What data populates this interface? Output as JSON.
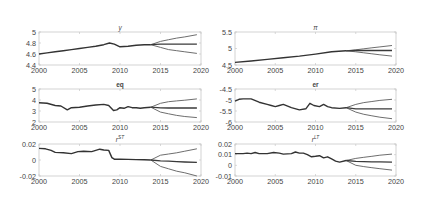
{
  "figure": {
    "width": 425,
    "height": 201,
    "background": "#ffffff",
    "axis_color": "#c8c8c8",
    "tick_label_color": "#4a4a4a",
    "history_color": "#333333",
    "forecast_central_color": "#3a3a3a",
    "forecast_band_color": "#6e6e6e"
  },
  "chart_data": [
    {
      "id": "y",
      "type": "line",
      "title": "y",
      "title_style": "italic",
      "xlim": [
        2000,
        2020
      ],
      "ylim": [
        4.4,
        5
      ],
      "xticks": [
        2000,
        2005,
        2010,
        2015,
        2020
      ],
      "yticks": [
        4.4,
        4.6,
        4.8,
        5
      ],
      "ytick_labels": [
        "4.4",
        "4.6",
        "4.8",
        "5"
      ],
      "show_xtick_labels": true,
      "history": {
        "x": [
          2000,
          2001,
          2002,
          2003,
          2004,
          2005,
          2006,
          2007,
          2008,
          2008.7,
          2009.3,
          2010,
          2011,
          2012,
          2013,
          2013.8
        ],
        "y": [
          4.6,
          4.62,
          4.64,
          4.66,
          4.68,
          4.7,
          4.72,
          4.74,
          4.77,
          4.8,
          4.78,
          4.73,
          4.74,
          4.76,
          4.77,
          4.77
        ]
      },
      "forecast": {
        "x": [
          2013.8,
          2015,
          2016,
          2017,
          2018,
          2019.5
        ],
        "upper": [
          4.77,
          4.83,
          4.86,
          4.89,
          4.91,
          4.95
        ],
        "central": [
          4.77,
          4.78,
          4.78,
          4.78,
          4.78,
          4.78
        ],
        "lower": [
          4.77,
          4.72,
          4.68,
          4.66,
          4.64,
          4.61
        ]
      }
    },
    {
      "id": "pi",
      "type": "line",
      "title": "π",
      "title_style": "italic",
      "xlim": [
        2000,
        2020
      ],
      "ylim": [
        4.5,
        5.5
      ],
      "xticks": [
        2000,
        2005,
        2010,
        2015,
        2020
      ],
      "yticks": [
        4.5,
        5,
        5.5
      ],
      "ytick_labels": [
        "4.5",
        "5",
        "5.5"
      ],
      "show_xtick_labels": true,
      "history": {
        "x": [
          2000,
          2002,
          2004,
          2006,
          2008,
          2010,
          2012,
          2013.8
        ],
        "y": [
          4.58,
          4.62,
          4.67,
          4.72,
          4.77,
          4.83,
          4.9,
          4.93
        ]
      },
      "forecast": {
        "x": [
          2013.8,
          2015,
          2016,
          2017,
          2018,
          2019.5
        ],
        "upper": [
          4.93,
          4.96,
          4.99,
          5.02,
          5.05,
          5.09
        ],
        "central": [
          4.93,
          4.94,
          4.94,
          4.94,
          4.94,
          4.94
        ],
        "lower": [
          4.93,
          4.9,
          4.87,
          4.84,
          4.81,
          4.77
        ]
      }
    },
    {
      "id": "eq",
      "type": "line",
      "title": "eq",
      "title_style": "bold",
      "xlim": [
        2000,
        2020
      ],
      "ylim": [
        2,
        5
      ],
      "xticks": [
        2000,
        2005,
        2010,
        2015,
        2020
      ],
      "yticks": [
        2,
        3,
        4,
        5
      ],
      "ytick_labels": [
        "2",
        "3",
        "4",
        "5"
      ],
      "show_xtick_labels": true,
      "history": {
        "x": [
          2000,
          2001,
          2002,
          2002.7,
          2003.5,
          2004,
          2005,
          2006,
          2007,
          2008,
          2008.6,
          2009.2,
          2009.6,
          2010,
          2010.5,
          2011,
          2011.5,
          2012,
          2012.5,
          2013,
          2013.8
        ],
        "y": [
          3.75,
          3.7,
          3.5,
          3.45,
          3.1,
          3.3,
          3.35,
          3.45,
          3.55,
          3.6,
          3.5,
          3.05,
          3.1,
          3.3,
          3.25,
          3.4,
          3.3,
          3.3,
          3.25,
          3.3,
          3.35
        ]
      },
      "forecast": {
        "x": [
          2013.8,
          2015,
          2016,
          2017,
          2018,
          2019.5
        ],
        "upper": [
          3.35,
          3.7,
          3.85,
          3.92,
          3.98,
          4.1
        ],
        "central": [
          3.35,
          3.28,
          3.27,
          3.27,
          3.27,
          3.27
        ],
        "lower": [
          3.35,
          2.9,
          2.75,
          2.6,
          2.5,
          2.4
        ]
      }
    },
    {
      "id": "er",
      "type": "line",
      "title": "er",
      "title_style": "bold",
      "xlim": [
        2000,
        2020
      ],
      "ylim": [
        -6,
        -4.5
      ],
      "xticks": [
        2000,
        2005,
        2010,
        2015,
        2020
      ],
      "yticks": [
        -6,
        -5.5,
        -5,
        -4.5
      ],
      "ytick_labels": [
        "-6",
        "-5.5",
        "-5",
        "-4.5"
      ],
      "show_xtick_labels": true,
      "history": {
        "x": [
          2000,
          2000.5,
          2001,
          2002,
          2003,
          2004,
          2004.5,
          2005,
          2005.5,
          2006,
          2007,
          2008,
          2008.8,
          2009.3,
          2009.8,
          2010.5,
          2011,
          2011.5,
          2012,
          2013,
          2013.8
        ],
        "y": [
          -5.05,
          -4.97,
          -4.95,
          -4.95,
          -5.1,
          -5.2,
          -5.25,
          -5.3,
          -5.25,
          -5.2,
          -5.35,
          -5.45,
          -5.4,
          -5.15,
          -5.25,
          -5.3,
          -5.2,
          -5.3,
          -5.35,
          -5.38,
          -5.35
        ]
      },
      "forecast": {
        "x": [
          2013.8,
          2015,
          2016,
          2017,
          2018,
          2019.5
        ],
        "upper": [
          -5.35,
          -5.2,
          -5.12,
          -5.07,
          -5.02,
          -4.97
        ],
        "central": [
          -5.35,
          -5.4,
          -5.4,
          -5.4,
          -5.4,
          -5.4
        ],
        "lower": [
          -5.35,
          -5.55,
          -5.65,
          -5.72,
          -5.78,
          -5.85
        ]
      }
    },
    {
      "id": "rST",
      "type": "line",
      "title": "r^ST",
      "title_base": "r",
      "title_sup": "ST",
      "title_style": "italic",
      "xlim": [
        2000,
        2020
      ],
      "ylim": [
        -0.02,
        0.02
      ],
      "xticks": [
        2000,
        2005,
        2010,
        2015,
        2020
      ],
      "yticks": [
        -0.02,
        0,
        0.02
      ],
      "ytick_labels": [
        "-0.02",
        "0",
        "0.02"
      ],
      "show_xtick_labels": true,
      "history": {
        "x": [
          2000,
          2000.8,
          2001.5,
          2002,
          2003,
          2004,
          2004.8,
          2005.5,
          2006.5,
          2007.5,
          2008,
          2008.6,
          2009,
          2009.3,
          2010,
          2011,
          2012,
          2013,
          2013.8
        ],
        "y": [
          0.0145,
          0.014,
          0.012,
          0.0095,
          0.009,
          0.008,
          0.0105,
          0.011,
          0.0105,
          0.0135,
          0.0125,
          0.012,
          0.003,
          0.001,
          0.001,
          0.0008,
          0.0005,
          0.0002,
          0.0
        ]
      },
      "forecast": {
        "x": [
          2013.8,
          2015,
          2016,
          2017,
          2018,
          2019.5
        ],
        "upper": [
          0.0,
          0.006,
          0.0075,
          0.009,
          0.011,
          0.014
        ],
        "central": [
          0.0,
          -0.001,
          -0.0015,
          -0.002,
          -0.0025,
          -0.003
        ],
        "lower": [
          0.0,
          -0.008,
          -0.011,
          -0.014,
          -0.016,
          -0.02
        ]
      }
    },
    {
      "id": "rLT",
      "type": "line",
      "title": "r^LT",
      "title_base": "r",
      "title_sup": "LT",
      "title_style": "italic",
      "xlim": [
        2000,
        2020
      ],
      "ylim": [
        -0.01,
        0.02
      ],
      "xticks": [
        2000,
        2005,
        2010,
        2015,
        2020
      ],
      "yticks": [
        -0.01,
        0,
        0.01,
        0.02
      ],
      "ytick_labels": [
        "-0.01",
        "0",
        "0.01",
        "0.02"
      ],
      "show_xtick_labels": true,
      "history": {
        "x": [
          2000,
          2001,
          2001.5,
          2002,
          2002.5,
          2003,
          2004,
          2004.8,
          2005.5,
          2006,
          2007,
          2007.5,
          2008,
          2008.5,
          2009,
          2009.5,
          2010,
          2010.5,
          2011,
          2011.5,
          2012,
          2012.5,
          2013,
          2013.8
        ],
        "y": [
          0.011,
          0.011,
          0.0115,
          0.011,
          0.012,
          0.011,
          0.011,
          0.012,
          0.0115,
          0.0105,
          0.011,
          0.0125,
          0.0115,
          0.0115,
          0.01,
          0.008,
          0.0085,
          0.009,
          0.007,
          0.008,
          0.006,
          0.004,
          0.003,
          0.0045
        ]
      },
      "forecast": {
        "x": [
          2013.8,
          2015,
          2016,
          2017,
          2018,
          2019.5
        ],
        "upper": [
          0.0045,
          0.0065,
          0.0075,
          0.0085,
          0.0095,
          0.0105
        ],
        "central": [
          0.0045,
          0.0038,
          0.0035,
          0.0033,
          0.0032,
          0.003
        ],
        "lower": [
          0.0045,
          0.0,
          -0.0012,
          -0.0022,
          -0.0032,
          -0.0045
        ]
      }
    }
  ]
}
